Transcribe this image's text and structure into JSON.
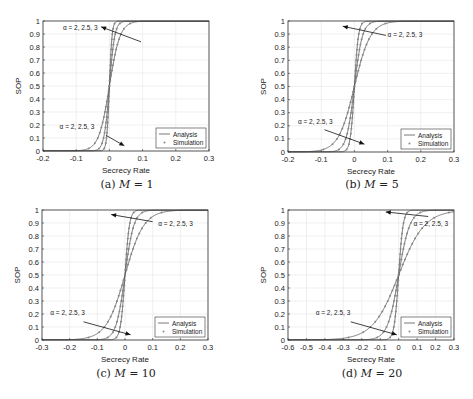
{
  "chart_data": [
    {
      "id": "a",
      "type": "line",
      "caption": "(a) M = 1",
      "caption_prefix": "(a)",
      "caption_var": "M",
      "caption_eq": "= 1",
      "xlabel": "Secrecy Rate",
      "ylabel": "SOP",
      "xlim": [
        -0.2,
        0.3
      ],
      "ylim": [
        0,
        1
      ],
      "xticks": [
        -0.2,
        -0.1,
        0,
        0.1,
        0.2,
        0.3
      ],
      "xtick_labels": [
        "-0.2",
        "-0.1",
        "0",
        "0.1",
        "0.2",
        "0.3"
      ],
      "yticks": [
        0,
        0.1,
        0.2,
        0.3,
        0.4,
        0.5,
        0.6,
        0.7,
        0.8,
        0.9,
        1
      ],
      "ytick_labels": [
        "0",
        "0.1",
        "0.2",
        "0.3",
        "0.4",
        "0.5",
        "0.6",
        "0.7",
        "0.8",
        "0.9",
        "1"
      ],
      "grid": true,
      "legend": {
        "position": "lower right",
        "entries": [
          "Analysis",
          "Simulation"
        ]
      },
      "annotations": [
        {
          "text": "α = 2, 2.5, 3",
          "tx": -0.14,
          "ty": 0.93,
          "ax0": 0.095,
          "ay0": 0.84,
          "ax1": -0.025,
          "ay1": 0.955
        },
        {
          "text": "α = 2, 2.5, 3",
          "tx": -0.15,
          "ty": 0.17,
          "ax0": -0.01,
          "ay0": 0.12,
          "ax1": 0.045,
          "ay1": 0.04
        }
      ],
      "series": [
        {
          "name": "α = 2",
          "scale": 0.004
        },
        {
          "name": "α = 2.5",
          "scale": 0.008
        },
        {
          "name": "α = 3",
          "scale": 0.016
        }
      ]
    },
    {
      "id": "b",
      "type": "line",
      "caption": "(b) M = 5",
      "caption_prefix": "(b)",
      "caption_var": "M",
      "caption_eq": "= 5",
      "xlabel": "Secrecy Rate",
      "ylabel": "SOP",
      "xlim": [
        -0.2,
        0.3
      ],
      "ylim": [
        0,
        1
      ],
      "xticks": [
        -0.2,
        -0.1,
        0,
        0.1,
        0.2,
        0.3
      ],
      "xtick_labels": [
        "-0.2",
        "-0.1",
        "0",
        "0.1",
        "0.2",
        "0.3"
      ],
      "yticks": [
        0,
        0.1,
        0.2,
        0.3,
        0.4,
        0.5,
        0.6,
        0.7,
        0.8,
        0.9,
        1
      ],
      "ytick_labels": [
        "0",
        "0.1",
        "0.2",
        "0.3",
        "0.4",
        "0.5",
        "0.6",
        "0.7",
        "0.8",
        "0.9",
        "1"
      ],
      "grid": true,
      "legend": {
        "position": "lower right",
        "entries": [
          "Analysis",
          "Simulation"
        ]
      },
      "annotations": [
        {
          "text": "α = 2, 2.5, 3",
          "tx": 0.1,
          "ty": 0.88,
          "ax0": 0.095,
          "ay0": 0.89,
          "ax1": -0.035,
          "ay1": 0.96
        },
        {
          "text": "α = 2, 2.5, 3",
          "tx": -0.17,
          "ty": 0.21,
          "ax0": -0.09,
          "ay0": 0.17,
          "ax1": 0.03,
          "ay1": 0.06
        }
      ],
      "series": [
        {
          "name": "α = 2",
          "scale": 0.006
        },
        {
          "name": "α = 2.5",
          "scale": 0.012
        },
        {
          "name": "α = 3",
          "scale": 0.024
        }
      ]
    },
    {
      "id": "c",
      "type": "line",
      "caption": "(c) M = 10",
      "caption_prefix": "(c)",
      "caption_var": "M",
      "caption_eq": "= 10",
      "xlabel": "Secrecy Rate",
      "ylabel": "SOP",
      "xlim": [
        -0.3,
        0.3
      ],
      "ylim": [
        0,
        1
      ],
      "xticks": [
        -0.3,
        -0.2,
        -0.1,
        0,
        0.1,
        0.2,
        0.3
      ],
      "xtick_labels": [
        "-0.3",
        "-0.2",
        "-0.1",
        "0",
        "0.1",
        "0.2",
        "0.3"
      ],
      "yticks": [
        0,
        0.1,
        0.2,
        0.3,
        0.4,
        0.5,
        0.6,
        0.7,
        0.8,
        0.9,
        1
      ],
      "ytick_labels": [
        "0",
        "0.1",
        "0.2",
        "0.3",
        "0.4",
        "0.5",
        "0.6",
        "0.7",
        "0.8",
        "0.9",
        "1"
      ],
      "grid": true,
      "legend": {
        "position": "lower right",
        "entries": [
          "Analysis",
          "Simulation"
        ]
      },
      "annotations": [
        {
          "text": "α = 2, 2.5, 3",
          "tx": 0.12,
          "ty": 0.88,
          "ax0": 0.1,
          "ay0": 0.91,
          "ax1": -0.05,
          "ay1": 0.965
        },
        {
          "text": "α = 2, 2.5, 3",
          "tx": -0.27,
          "ty": 0.19,
          "ax0": -0.15,
          "ay0": 0.14,
          "ax1": 0.02,
          "ay1": 0.04
        }
      ],
      "series": [
        {
          "name": "α = 2",
          "scale": 0.008
        },
        {
          "name": "α = 2.5",
          "scale": 0.016
        },
        {
          "name": "α = 3",
          "scale": 0.034
        }
      ]
    },
    {
      "id": "d",
      "type": "line",
      "caption": "(d) M = 20",
      "caption_prefix": "(d)",
      "caption_var": "M",
      "caption_eq": "= 20",
      "xlabel": "Secrecy Rate",
      "ylabel": "SOP",
      "xlim": [
        -0.6,
        0.3
      ],
      "ylim": [
        0,
        1
      ],
      "xticks": [
        -0.6,
        -0.5,
        -0.4,
        -0.3,
        -0.2,
        -0.1,
        0,
        0.1,
        0.2,
        0.3
      ],
      "xtick_labels": [
        "-0.6",
        "-0.5",
        "-0.4",
        "-0.3",
        "-0.2",
        "-0.1",
        "0",
        "0.1",
        "0.2",
        "0.3"
      ],
      "yticks": [
        0,
        0.1,
        0.2,
        0.3,
        0.4,
        0.5,
        0.6,
        0.7,
        0.8,
        0.9,
        1
      ],
      "ytick_labels": [
        "0",
        "0.1",
        "0.2",
        "0.3",
        "0.4",
        "0.5",
        "0.6",
        "0.7",
        "0.8",
        "0.9",
        "1"
      ],
      "grid": true,
      "legend": {
        "position": "lower right",
        "entries": [
          "Analysis",
          "Simulation"
        ]
      },
      "annotations": [
        {
          "text": "α = 2, 2.5, 3",
          "tx": 0.08,
          "ty": 0.88,
          "ax0": 0.16,
          "ay0": 0.95,
          "ax1": -0.07,
          "ay1": 0.985
        },
        {
          "text": "α = 2, 2.5, 3",
          "tx": -0.45,
          "ty": 0.19,
          "ax0": -0.26,
          "ay0": 0.14,
          "ax1": -0.01,
          "ay1": 0.04
        }
      ],
      "series": [
        {
          "name": "α = 2",
          "scale": 0.012
        },
        {
          "name": "α = 2.5",
          "scale": 0.03
        },
        {
          "name": "α = 3",
          "scale": 0.07
        }
      ]
    }
  ],
  "layout": {
    "panels": [
      {
        "left": 43,
        "top": 21,
        "width": 166,
        "height": 130,
        "cap_x": 27,
        "cap_y": 178
      },
      {
        "left": 288,
        "top": 21,
        "width": 166,
        "height": 131,
        "cap_x": 272,
        "cap_y": 178
      },
      {
        "left": 42,
        "top": 210,
        "width": 166,
        "height": 130,
        "cap_x": 26,
        "cap_y": 367
      },
      {
        "left": 288,
        "top": 210,
        "width": 166,
        "height": 130,
        "cap_x": 272,
        "cap_y": 367
      }
    ],
    "colors": {
      "axis": "#333333",
      "grid": "#e6e6e6",
      "line": "#555555",
      "marker": "#888888",
      "text": "#222222"
    }
  }
}
